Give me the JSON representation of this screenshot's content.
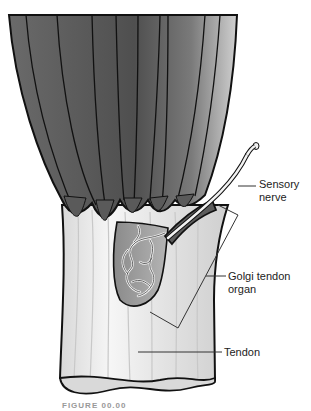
{
  "diagram": {
    "labels": {
      "sensory_nerve_line1": "Sensory",
      "sensory_nerve_line2": "nerve",
      "golgi_line1": "Golgi tendon",
      "golgi_line2": "organ",
      "tendon": "Tendon"
    },
    "caption": "FIGURE 00.00",
    "colors": {
      "muscle_dark": "#4f4f4f",
      "muscle_light": "#b8b8b8",
      "tendon": "#eeeeee",
      "outline": "#111111",
      "leader_line": "#333333"
    }
  }
}
